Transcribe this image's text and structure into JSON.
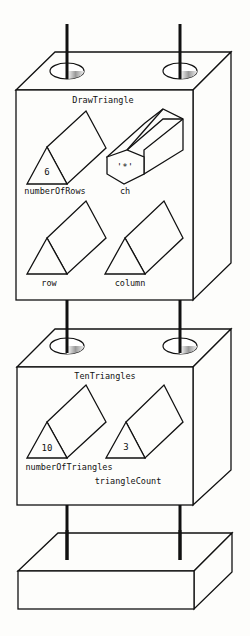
{
  "diagram": {
    "frames": [
      {
        "name": "DrawTriangle",
        "variables": [
          {
            "name": "numberOfRows",
            "value": "6",
            "shape": "triangular-prism"
          },
          {
            "name": "ch",
            "value": "'*'",
            "shape": "hexagonal-prism"
          },
          {
            "name": "row",
            "value": "",
            "shape": "triangular-prism"
          },
          {
            "name": "column",
            "value": "",
            "shape": "triangular-prism"
          }
        ]
      },
      {
        "name": "TenTriangles",
        "variables": [
          {
            "name": "numberOfTriangles",
            "value": "10",
            "shape": "triangular-prism"
          },
          {
            "name": "triangleCount",
            "value": "3",
            "shape": "triangular-prism"
          }
        ]
      },
      {
        "name": "",
        "variables": []
      }
    ]
  }
}
